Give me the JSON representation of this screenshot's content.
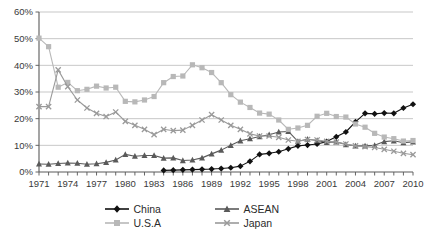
{
  "chart_data": {
    "type": "line",
    "title": "",
    "subtitle": "",
    "xlabel": "",
    "ylabel": "",
    "xlim": [
      1971,
      2010
    ],
    "ylim": [
      0,
      60
    ],
    "ytick_format": "percent",
    "grid": "horizontal",
    "legend_position": "bottom",
    "x": [
      1971,
      1972,
      1973,
      1974,
      1975,
      1976,
      1977,
      1978,
      1979,
      1980,
      1981,
      1982,
      1983,
      1984,
      1985,
      1986,
      1987,
      1988,
      1989,
      1990,
      1991,
      1992,
      1993,
      1994,
      1995,
      1996,
      1997,
      1998,
      1999,
      2000,
      2001,
      2002,
      2003,
      2004,
      2005,
      2006,
      2007,
      2008,
      2009,
      2010
    ],
    "xticks": [
      1971,
      1974,
      1977,
      1980,
      1983,
      1986,
      1989,
      1992,
      1995,
      1998,
      2001,
      2004,
      2007,
      2010
    ],
    "xtick_labels": [
      "1971",
      "1974",
      "1977",
      "1980",
      "1983",
      "1986",
      "1989",
      "1992",
      "1995",
      "1998",
      "2001",
      "2004",
      "2007",
      "2010"
    ],
    "yticks": [
      0,
      10,
      20,
      30,
      40,
      50,
      60
    ],
    "ytick_labels": [
      "0%",
      "10%",
      "20%",
      "30%",
      "40%",
      "50%",
      "60%"
    ],
    "series": [
      {
        "name": "China",
        "color": "#111111",
        "marker": "diamond",
        "x_start": 1984,
        "values": [
          null,
          null,
          null,
          null,
          null,
          null,
          null,
          null,
          null,
          null,
          null,
          null,
          null,
          0.6,
          0.7,
          0.8,
          0.9,
          1.0,
          1.1,
          1.3,
          1.6,
          2.2,
          4.0,
          6.6,
          7.0,
          7.6,
          8.7,
          9.8,
          10.1,
          10.5,
          11.4,
          13.2,
          15.0,
          18.8,
          22.0,
          21.8,
          22.1,
          22.0,
          24.0,
          25.4
        ]
      },
      {
        "name": "ASEAN",
        "color": "#5a5a5a",
        "marker": "triangle",
        "x_start": 1971,
        "values": [
          3.0,
          2.9,
          3.2,
          3.4,
          3.3,
          2.9,
          3.1,
          3.6,
          4.5,
          6.6,
          5.9,
          6.2,
          6.2,
          5.2,
          5.3,
          4.3,
          4.5,
          5.3,
          6.8,
          8.2,
          10.0,
          11.7,
          12.5,
          13.3,
          14.0,
          15.0,
          15.2,
          11.5,
          12.3,
          11.8,
          11.1,
          11.3,
          10.3,
          9.8,
          9.8,
          10.0,
          11.4,
          11.7,
          11.0,
          11.3
        ]
      },
      {
        "name": "U.S.A",
        "color": "#b8b8b8",
        "marker": "square",
        "x_start": 1971,
        "values": [
          50.2,
          47.0,
          31.8,
          33.6,
          30.5,
          31.0,
          32.2,
          31.5,
          31.8,
          26.5,
          26.3,
          27.0,
          28.3,
          33.5,
          35.8,
          36.0,
          40.2,
          39.1,
          37.3,
          33.5,
          29.0,
          26.2,
          24.2,
          22.1,
          21.7,
          19.5,
          16.0,
          16.5,
          17.5,
          20.9,
          22.0,
          20.8,
          20.6,
          18.0,
          16.8,
          14.5,
          13.1,
          12.5,
          11.6,
          11.8
        ]
      },
      {
        "name": "Japan",
        "color": "#9a9a9a",
        "marker": "cross",
        "x_start": 1971,
        "values": [
          24.5,
          24.5,
          38.3,
          32.0,
          27.0,
          24.0,
          22.0,
          20.8,
          22.5,
          19.0,
          17.5,
          16.0,
          14.0,
          16.0,
          15.5,
          15.7,
          17.5,
          19.5,
          21.5,
          19.5,
          17.5,
          16.0,
          14.3,
          13.5,
          13.5,
          13.0,
          12.0,
          11.5,
          12.2,
          12.0,
          11.5,
          11.2,
          10.5,
          9.8,
          9.5,
          9.2,
          8.5,
          7.8,
          7.0,
          6.5
        ]
      }
    ]
  },
  "legend": {
    "items": [
      {
        "label": "China",
        "key": "china-key"
      },
      {
        "label": "ASEAN",
        "key": "asean-key"
      },
      {
        "label": "U.S.A",
        "key": "usa-key"
      },
      {
        "label": "Japan",
        "key": "japan-key"
      }
    ]
  }
}
